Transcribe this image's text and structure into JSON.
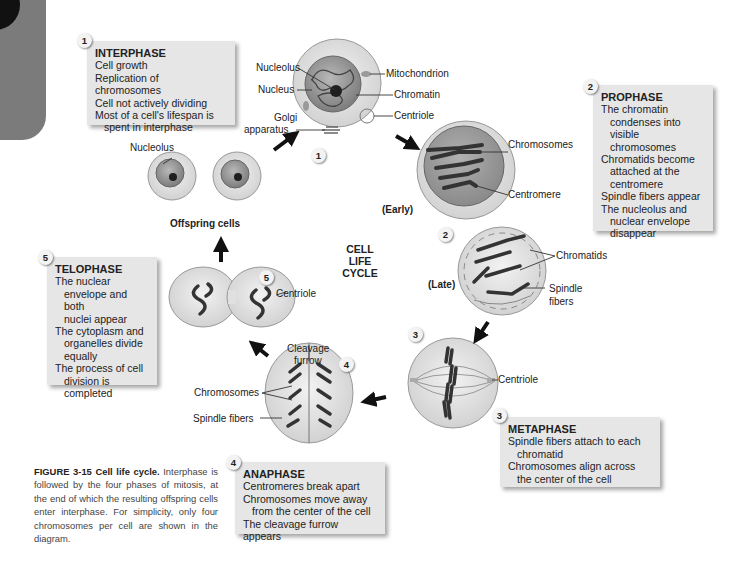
{
  "figure": {
    "center_title": [
      "CELL",
      "LIFE",
      "CYCLE"
    ],
    "caption_bold": "FIGURE 3-15 Cell life cycle.",
    "caption_text": " Interphase is followed by the four phases of mitosis, at the end of which the resulting offspring cells enter interphase. For simplicity, only four chromosomes per cell are shown in the diagram."
  },
  "phases": [
    {
      "number": "1",
      "title": "INTERPHASE",
      "lines": [
        "Cell growth",
        "Replication of chromosomes",
        "Cell not actively dividing",
        "Most of a cell's lifespan is",
        "spent in interphase"
      ],
      "indented": [
        false,
        false,
        false,
        false,
        true
      ]
    },
    {
      "number": "2",
      "title": "PROPHASE",
      "lines": [
        "The chromatin",
        "condenses into visible",
        "chromosomes",
        "Chromatids become",
        "attached at the",
        "centromere",
        "Spindle fibers appear",
        "The nucleolus and",
        "nuclear envelope",
        "disappear"
      ],
      "indented": [
        false,
        true,
        true,
        false,
        true,
        true,
        false,
        false,
        true,
        true
      ]
    },
    {
      "number": "3",
      "title": "METAPHASE",
      "lines": [
        "Spindle fibers attach to each",
        "chromatid",
        "Chromosomes align across",
        "the center of the cell"
      ],
      "indented": [
        false,
        true,
        false,
        true
      ]
    },
    {
      "number": "4",
      "title": "ANAPHASE",
      "lines": [
        "Centromeres break apart",
        "Chromosomes move away",
        "from the center of the cell",
        "The cleavage furrow appears"
      ],
      "indented": [
        false,
        false,
        true,
        false
      ]
    },
    {
      "number": "5",
      "title": "TELOPHASE",
      "lines": [
        "The nuclear",
        "envelope and both",
        "nuclei appear",
        "The cytoplasm and",
        "organelles divide",
        "equally",
        "The process of cell",
        "division is",
        "completed"
      ],
      "indented": [
        false,
        true,
        true,
        false,
        true,
        true,
        false,
        true,
        true
      ]
    }
  ],
  "cell_badges": [
    "1",
    "2",
    "3",
    "4",
    "5"
  ],
  "labels": {
    "interphase_cell": {
      "nucleolus": "Nucleolus",
      "nucleus": "Nucleus",
      "golgi": [
        "Golgi",
        "apparatus"
      ],
      "mitochondrion": "Mitochondrion",
      "chromatin": "Chromatin",
      "centriole": "Centriole"
    },
    "offspring": {
      "nucleolus": "Nucleolus",
      "title": "Offspring cells"
    },
    "prophase_early": {
      "chromosomes": "Chromosomes",
      "centromere": "Centromere",
      "stage": "(Early)"
    },
    "prophase_late": {
      "chromatids": "Chromatids",
      "spindle_fibers": [
        "Spindle",
        "fibers"
      ],
      "stage": "(Late)"
    },
    "metaphase": {
      "centriole": "Centriole"
    },
    "anaphase": {
      "cleavage_furrow": [
        "Cleavage",
        "furrow"
      ],
      "chromosomes": "Chromosomes",
      "spindle_fibers": "Spindle fibers"
    },
    "telophase": {
      "centriole": "Centriole"
    }
  },
  "colors": {
    "box_bg": "#e6e6e6",
    "cell_outer": "#e4e4e4",
    "cell_dark": "#8a8a8a",
    "chromosome": "#3a3a3a",
    "arrow": "#111111"
  }
}
